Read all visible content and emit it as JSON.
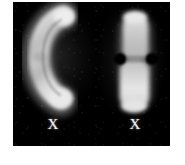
{
  "figure": {
    "name": "chromosome-micrograph",
    "background_color": "#ffffff",
    "panel_color": "#000000",
    "stain_color": "#d8d8d8",
    "label_color": "#f2f2f2",
    "caption": ""
  },
  "panel": {
    "left": 13,
    "top": 2,
    "width": 157,
    "height": 144
  },
  "specimens": [
    {
      "id": "chromosome-left",
      "label": "X",
      "shape": "bent-c-shaped",
      "orientation": "curved-open-right",
      "center_x": 40,
      "top_y": 8,
      "bottom_y": 103,
      "arm_width": 22,
      "brightness": "bright"
    },
    {
      "id": "chromosome-right",
      "label": "X",
      "shape": "straight-submetacentric",
      "orientation": "vertical",
      "center_x": 122,
      "top_y": 10,
      "bottom_y": 110,
      "arm_width": 26,
      "centromere_y": 58,
      "brightness": "bright"
    }
  ],
  "labels": {
    "left": "X",
    "right": "X"
  }
}
